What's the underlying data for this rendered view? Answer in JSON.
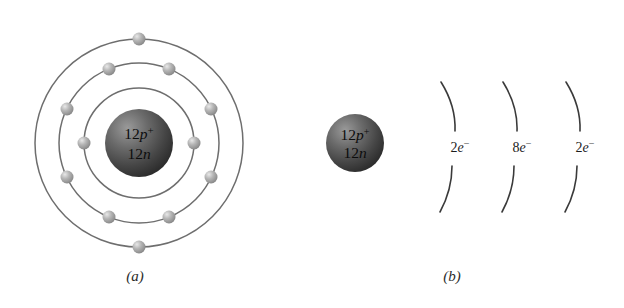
{
  "figure": {
    "background_color": "#ffffff",
    "orbit_stroke_color": "#6e6e6e",
    "electron_color": "#a8a8a8",
    "electron_highlight_color": "#e2e2e2",
    "nucleus_dark_color": "#3a3a3a",
    "nucleus_light_color": "#8e8e8e",
    "arc_stroke_color": "#3a3a3a",
    "text_color": "#1c1c1c"
  },
  "panel_a": {
    "caption": "(a)",
    "nucleus": {
      "protons_label": "12p",
      "protons_superscript": "+",
      "neutrons_label": "12n",
      "center_x": 139,
      "center_y": 143,
      "radius": 34
    },
    "shells": [
      {
        "name": "shell-1",
        "radius": 55,
        "electron_count": 2
      },
      {
        "name": "shell-2",
        "radius": 80,
        "electron_count": 8
      },
      {
        "name": "shell-3",
        "radius": 104,
        "electron_count": 2
      }
    ],
    "electrons": [
      {
        "shell": 1,
        "angle": 180
      },
      {
        "shell": 1,
        "angle": 0
      },
      {
        "shell": 2,
        "angle": 248
      },
      {
        "shell": 2,
        "angle": 292
      },
      {
        "shell": 2,
        "angle": 205
      },
      {
        "shell": 2,
        "angle": 335
      },
      {
        "shell": 2,
        "angle": 155
      },
      {
        "shell": 2,
        "angle": 25
      },
      {
        "shell": 2,
        "angle": 112
      },
      {
        "shell": 2,
        "angle": 68
      },
      {
        "shell": 3,
        "angle": 90
      },
      {
        "shell": 3,
        "angle": 270
      }
    ],
    "electron_radius": 6.5
  },
  "panel_b": {
    "caption": "(b)",
    "nucleus": {
      "protons_label": "12p",
      "protons_superscript": "+",
      "neutrons_label": "12n",
      "center_x": 355,
      "center_y": 143,
      "radius": 29
    },
    "shell_arcs": [
      {
        "name": "shell-arc-1",
        "count_label": "2",
        "electron_label": "e",
        "charge_superscript": "−",
        "label_x": 467,
        "label_y": 148,
        "arc_x": 449
      },
      {
        "name": "shell-arc-2",
        "count_label": "8",
        "electron_label": "e",
        "charge_superscript": "−",
        "label_x": 526,
        "label_y": 148,
        "arc_x": 508
      },
      {
        "name": "shell-arc-3",
        "count_label": "2",
        "electron_label": "e",
        "charge_superscript": "−",
        "label_x": 589,
        "label_y": 148,
        "arc_x": 571
      }
    ]
  },
  "chart_data": {
    "type": "diagram",
    "atomic_number": 12,
    "neutron_count": 12,
    "nucleus_composition": "12p+ 12n",
    "electron_shells": [
      {
        "shell": 1,
        "electrons": 2,
        "label": "2e−"
      },
      {
        "shell": 2,
        "electrons": 8,
        "label": "8e−"
      },
      {
        "shell": 3,
        "electrons": 2,
        "label": "2e−"
      }
    ],
    "total_electrons": 12,
    "panels": [
      {
        "id": "a",
        "caption": "(a)",
        "description": "concentric circular orbit model with electrons drawn as spheres"
      },
      {
        "id": "b",
        "caption": "(b)",
        "description": "nucleus with three shell arcs labeled by electron count"
      }
    ]
  }
}
